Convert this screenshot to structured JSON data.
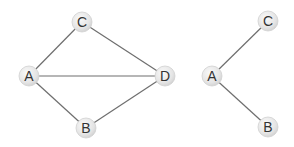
{
  "graphs": [
    {
      "name": "graph-left",
      "nodes": [
        {
          "id": "C",
          "label": "C",
          "x": 82,
          "y": 22
        },
        {
          "id": "A",
          "label": "A",
          "x": 29,
          "y": 76
        },
        {
          "id": "D",
          "label": "D",
          "x": 165,
          "y": 76
        },
        {
          "id": "B",
          "label": "B",
          "x": 86,
          "y": 128
        }
      ],
      "edges": [
        [
          "A",
          "C"
        ],
        [
          "A",
          "D"
        ],
        [
          "A",
          "B"
        ],
        [
          "C",
          "D"
        ],
        [
          "B",
          "D"
        ]
      ]
    },
    {
      "name": "graph-right",
      "nodes": [
        {
          "id": "A",
          "label": "A",
          "x": 212,
          "y": 76
        },
        {
          "id": "C",
          "label": "C",
          "x": 268,
          "y": 21
        },
        {
          "id": "B",
          "label": "B",
          "x": 268,
          "y": 127
        }
      ],
      "edges": [
        [
          "A",
          "C"
        ],
        [
          "A",
          "B"
        ]
      ]
    }
  ],
  "colors": {
    "edge": "#6e6e6e",
    "node_fill_light": "#f4f4f4",
    "node_fill_dark": "#d6d6d6",
    "label": "#333333"
  }
}
